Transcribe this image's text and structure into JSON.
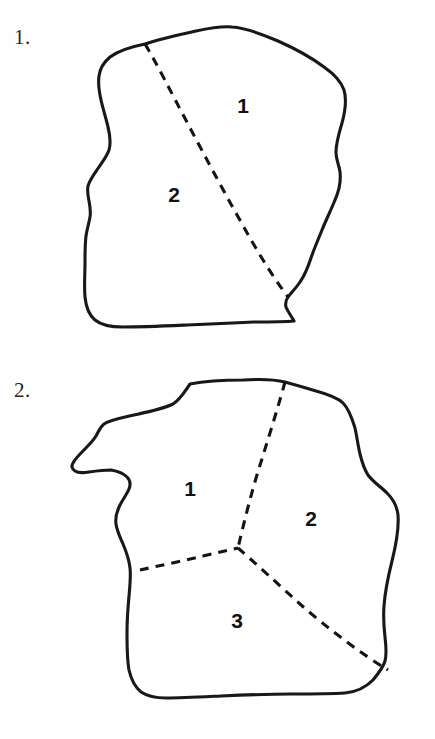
{
  "page": {
    "background_color": "#fefefe",
    "ink_color": "#181818"
  },
  "figures": [
    {
      "number_label": "1.",
      "name": "figure-1",
      "region_count": 2,
      "divider_count": 1,
      "regions": [
        {
          "label": "1",
          "x": 243,
          "y": 107
        },
        {
          "label": "2",
          "x": 174,
          "y": 196
        }
      ],
      "outline_path": "M 145 44 C 160 39 178 35 196 31 C 210 28 222 26 232 27 C 246 28 262 34 278 41 C 296 49 312 58 324 67 C 334 74 341 81 344 90 C 347 100 345 112 342 123 C 339 133 336 143 336 152 C 336 159 339 165 340 172 C 341 181 339 191 335 200 C 331 210 326 220 322 230 C 318 240 314 249 311 258 C 308 267 305 275 300 282 C 296 288 291 293 288 297 C 286 300 285 303 286 307 C 288 312 292 317 294 321 C 283 322 269 322 254 322 C 232 323 208 324 187 325 C 164 326 142 327 123 327 C 110 327 101 325 95 320 C 89 315 86 307 85 297 C 84 286 85 274 85 263 C 85 253 85 244 86 236 C 87 229 89 223 90 217 C 91 211 90 206 89 201 C 88 196 87 191 88 186 C 90 179 95 173 99 167 C 103 161 107 156 109 150 C 111 143 110 135 108 127 C 106 118 103 109 101 100 C 99 91 98 83 99 76 C 100 68 104 62 110 57 C 118 51 130 47 145 44 Z",
      "dividers": [
        {
          "name": "divider-1-2",
          "path": "M 145 44 C 157 64 172 94 189 126 C 208 162 230 203 250 238 C 263 261 276 281 288 297"
        }
      ]
    },
    {
      "number_label": "2.",
      "name": "figure-2",
      "region_count": 3,
      "divider_count": 3,
      "junction": {
        "x": 238,
        "y": 548
      },
      "regions": [
        {
          "label": "1",
          "x": 190,
          "y": 490
        },
        {
          "label": "2",
          "x": 311,
          "y": 520
        },
        {
          "label": "3",
          "x": 237,
          "y": 622
        }
      ],
      "outline_path": "M 190 384 C 205 381 224 380 243 380 C 259 379 273 379 285 382 C 296 385 306 388 316 391 C 327 394 337 397 343 403 C 349 409 352 418 355 428 C 357 437 358 446 360 454 C 362 462 364 469 368 475 C 373 482 381 487 387 493 C 393 499 397 506 398 515 C 399 528 396 545 392 561 C 388 577 385 592 384 606 C 383 618 384 628 385 637 C 386 646 387 654 385 661 C 383 668 378 674 373 680 C 366 687 357 692 345 693 C 330 694 311 694 291 694 C 267 694 243 695 221 696 C 200 697 181 698 166 698 C 155 698 147 696 141 692 C 135 687 131 679 129 670 C 127 659 127 646 127 633 C 127 620 128 607 129 596 C 130 585 131 576 130 568 C 129 559 126 551 123 544 C 120 537 117 531 116 524 C 115 517 117 511 120 505 C 123 499 127 494 129 489 C 131 484 130 480 127 477 C 123 473 117 471 111 470 C 104 470 96 471 89 472 C 83 473 78 473 75 471 C 72 469 71 466 73 463 C 75 459 79 455 83 451 C 88 446 93 441 96 436 C 99 431 100 427 104 424 C 110 420 121 418 134 415 C 148 412 163 409 173 404 C 181 399 185 391 190 384 Z",
      "dividers": [
        {
          "name": "divider-top",
          "path": "M 285 382 C 279 404 270 433 261 462 C 252 490 244 522 238 548"
        },
        {
          "name": "divider-left",
          "path": "M 140 570 C 158 566 182 561 203 556 C 216 553 229 550 238 548"
        },
        {
          "name": "divider-bottom-right",
          "path": "M 238 548 C 254 562 277 583 300 604 C 326 627 360 653 388 670"
        }
      ]
    }
  ]
}
